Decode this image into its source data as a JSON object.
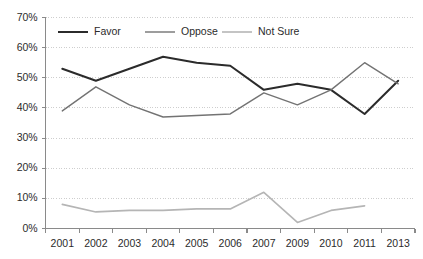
{
  "chart_data": {
    "type": "line",
    "title": "",
    "subtitle": "",
    "xlabel": "",
    "ylabel": "",
    "categories": [
      "2001",
      "2002",
      "2003",
      "2004",
      "2005",
      "2006",
      "2007",
      "2009",
      "2010",
      "2011",
      "2013"
    ],
    "ylim": [
      0,
      70
    ],
    "ytick_labels": [
      "0%",
      "10%",
      "20%",
      "30%",
      "40%",
      "50%",
      "60%",
      "70%"
    ],
    "ytick_values": [
      0,
      10,
      20,
      30,
      40,
      50,
      60,
      70
    ],
    "grid": "horizontal-dotted",
    "legend_position": "top-inside",
    "series": [
      {
        "name": "Favor",
        "color": "#2b2b2b",
        "width": 2.0,
        "values": [
          53,
          49,
          53,
          57,
          55,
          54,
          46,
          48,
          46,
          38,
          49
        ]
      },
      {
        "name": "Oppose",
        "color": "#737373",
        "width": 1.4,
        "values": [
          39,
          47,
          41,
          37,
          37.5,
          38,
          45,
          41,
          46,
          55,
          48
        ]
      },
      {
        "name": "Not Sure",
        "color": "#b5b5b5",
        "width": 1.6,
        "values": [
          8,
          5.5,
          6,
          6,
          6.5,
          6.5,
          12,
          2,
          6,
          7.5,
          null
        ]
      }
    ]
  },
  "legend": {
    "items": [
      {
        "label": "Favor",
        "color": "#2b2b2b"
      },
      {
        "label": "Oppose",
        "color": "#737373"
      },
      {
        "label": "Not Sure",
        "color": "#b5b5b5"
      }
    ]
  },
  "axes": {
    "y_labels": [
      "70%",
      "60%",
      "50%",
      "40%",
      "30%",
      "20%",
      "10%",
      "0%"
    ],
    "x_labels": [
      "2001",
      "2002",
      "2003",
      "2004",
      "2005",
      "2006",
      "2007",
      "2009",
      "2010",
      "2011",
      "2013"
    ]
  }
}
